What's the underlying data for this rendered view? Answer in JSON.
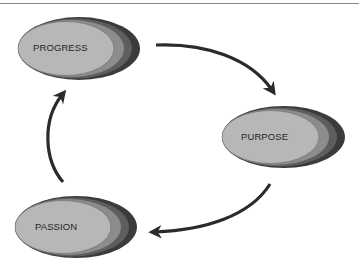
{
  "diagram": {
    "type": "cycle",
    "nodes": [
      {
        "id": "progress",
        "label": "PROGRESS"
      },
      {
        "id": "purpose",
        "label": "PURPOSE"
      },
      {
        "id": "passion",
        "label": "PASSION"
      }
    ],
    "edges": [
      {
        "from": "progress",
        "to": "purpose"
      },
      {
        "from": "purpose",
        "to": "passion"
      },
      {
        "from": "passion",
        "to": "progress"
      }
    ],
    "colors": {
      "inner_fill": "#b7b7b7",
      "layer_2": "#8c8c8c",
      "layer_3": "#5e5e5e",
      "layer_4": "#3b3b3b",
      "arrow": "#2b2b2b",
      "rule": "#8a8a8a"
    }
  }
}
